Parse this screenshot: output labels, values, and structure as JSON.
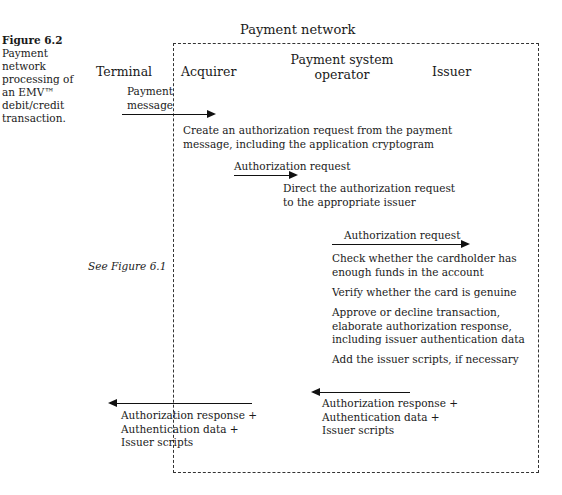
{
  "caption": {
    "figure_label": "Figure 6.2",
    "text": "Payment network processing of an EMV™ debit/credit transaction."
  },
  "network_title": "Payment network",
  "lanes": {
    "terminal": "Terminal",
    "acquirer": "Acquirer",
    "pso_line1": "Payment system",
    "pso_line2": "operator",
    "issuer": "Issuer"
  },
  "messages": {
    "payment_message_line1": "Payment",
    "payment_message_line2": "message",
    "auth_request_1": "Authorization request",
    "auth_request_2": "Authorization request",
    "response_pso": [
      "Authorization response +",
      "Authentication data +",
      "Issuer scripts"
    ],
    "response_terminal": [
      "Authorization response +",
      "Authentication data +",
      "Issuer scripts"
    ]
  },
  "steps": {
    "acquirer_create": [
      "Create an authorization request from the payment",
      "message, including the application cryptogram"
    ],
    "pso_direct": [
      "Direct the authorization request",
      "to the appropriate issuer"
    ],
    "issuer_check_funds": [
      "Check whether the cardholder has",
      "enough funds in the account"
    ],
    "issuer_verify_card": [
      "Verify whether the card is genuine"
    ],
    "issuer_approve": [
      "Approve or decline transaction,",
      "elaborate authorization response,",
      "including issuer authentication data"
    ],
    "issuer_scripts": [
      "Add the issuer scripts, if necessary"
    ]
  },
  "see_figure": "See Figure 6.1",
  "arrows": [
    {
      "from": "terminal",
      "to": "acquirer",
      "direction": "right"
    },
    {
      "from": "acquirer",
      "to": "payment-system-operator",
      "direction": "right"
    },
    {
      "from": "payment-system-operator",
      "to": "issuer",
      "direction": "right"
    },
    {
      "from": "issuer",
      "to": "payment-system-operator",
      "direction": "left"
    },
    {
      "from": "acquirer",
      "to": "terminal",
      "direction": "left"
    }
  ]
}
